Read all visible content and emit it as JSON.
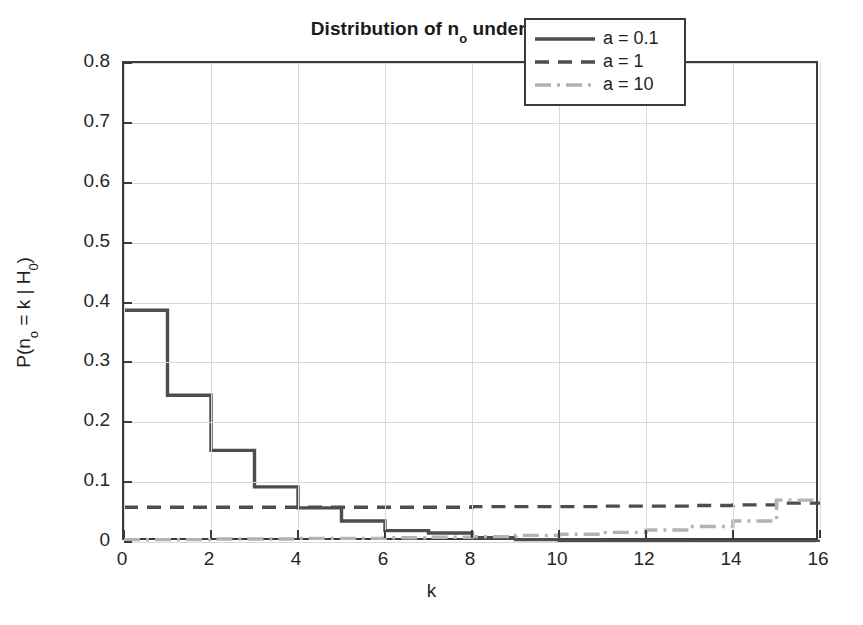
{
  "title": {
    "prefix": "Distribution of n",
    "sub1": "o",
    "mid": " under H",
    "sub2": "0",
    "full": "Distribution of n_o under H_0"
  },
  "axes": {
    "xlabel": "k",
    "ylabel_prefix": "P(n",
    "ylabel_sub1": "o",
    "ylabel_mid": " = k | H",
    "ylabel_sub2": "0",
    "ylabel_suffix": ")",
    "ylabel_full": "P(n_o = k | H_0)",
    "xticks": [
      "0",
      "2",
      "4",
      "6",
      "8",
      "10",
      "12",
      "14",
      "16"
    ],
    "yticks": [
      "0",
      "0.1",
      "0.2",
      "0.3",
      "0.4",
      "0.5",
      "0.6",
      "0.7",
      "0.8"
    ]
  },
  "legend": {
    "items": [
      {
        "label": "a = 0.1",
        "style": "solid",
        "color": "#4d4d4d"
      },
      {
        "label": "a = 1",
        "style": "dashed",
        "color": "#4d4d4d"
      },
      {
        "label": "a = 10",
        "style": "dashdot",
        "color": "#b3b3b3"
      }
    ]
  },
  "chart_data": {
    "type": "line",
    "xlabel": "k",
    "ylabel": "P(n_o = k | H_0)",
    "xlim": [
      0,
      16
    ],
    "ylim": [
      0,
      0.8
    ],
    "xticks": [
      0,
      2,
      4,
      6,
      8,
      10,
      12,
      14,
      16
    ],
    "yticks": [
      0,
      0.1,
      0.2,
      0.3,
      0.4,
      0.5,
      0.6,
      0.7,
      0.8
    ],
    "grid": true,
    "legend_position": "upper right",
    "drawstyle": "steps-post",
    "x": [
      0,
      1,
      2,
      3,
      4,
      5,
      6,
      7,
      8,
      9,
      10,
      11,
      12,
      13,
      14,
      15,
      16
    ],
    "series": [
      {
        "name": "a = 0.1",
        "style": "solid",
        "color": "#4d4d4d",
        "values": [
          0.387,
          0.245,
          0.153,
          0.092,
          0.057,
          0.035,
          0.019,
          0.015,
          0.007,
          0.004,
          0.003,
          0.002,
          0.002,
          0.001,
          0.001,
          0.001,
          0.001
        ]
      },
      {
        "name": "a = 1",
        "style": "dashed",
        "color": "#4d4d4d",
        "values": [
          0.058,
          0.058,
          0.058,
          0.058,
          0.058,
          0.058,
          0.058,
          0.058,
          0.059,
          0.059,
          0.059,
          0.06,
          0.06,
          0.061,
          0.062,
          0.065,
          0.065
        ]
      },
      {
        "name": "a = 10",
        "style": "dashdot",
        "color": "#b3b3b3",
        "values": [
          0.004,
          0.004,
          0.005,
          0.005,
          0.006,
          0.006,
          0.007,
          0.008,
          0.009,
          0.011,
          0.013,
          0.016,
          0.02,
          0.026,
          0.035,
          0.07,
          0.07
        ]
      }
    ]
  }
}
